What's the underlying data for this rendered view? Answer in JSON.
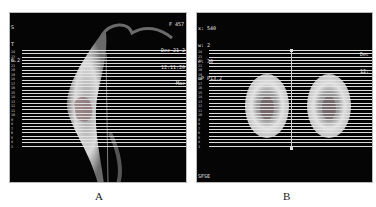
{
  "panels": [
    {
      "id": "A",
      "label": "A",
      "view": "sagittal",
      "overlay_top_left": [
        "S",
        "T",
        "6.2"
      ],
      "overlay_top_right": [
        "F 457"
      ],
      "overlay_right": [
        "Dec 21 2",
        "12:11:20",
        "Mac"
      ],
      "slice_tick_labels": [
        "24",
        "23",
        "22",
        "21",
        "20",
        "19",
        "18",
        "17",
        "16",
        "15",
        "14",
        "13",
        "12",
        "11",
        "10",
        "9",
        "8",
        "7",
        "6",
        "5",
        "4",
        "3"
      ]
    },
    {
      "id": "B",
      "label": "B",
      "view": "axial",
      "overlay_top_left": [
        "x: 540",
        "w: 2",
        "e: 30",
        "oP P13.2"
      ],
      "overlay_right": [
        "Dec",
        "12:"
      ],
      "overlay_bottom_left": "SFSE",
      "slice_tick_labels": [
        "24",
        "23",
        "22",
        "21",
        "20",
        "19",
        "18",
        "17",
        "16",
        "15",
        "14",
        "13",
        "12",
        "11",
        "10",
        "9",
        "8",
        "7",
        "6",
        "5",
        "4",
        "3"
      ]
    }
  ],
  "colors": {
    "background": "#ffffff",
    "image_bg": "#050505",
    "slice_lines": "#e6e6e6"
  }
}
